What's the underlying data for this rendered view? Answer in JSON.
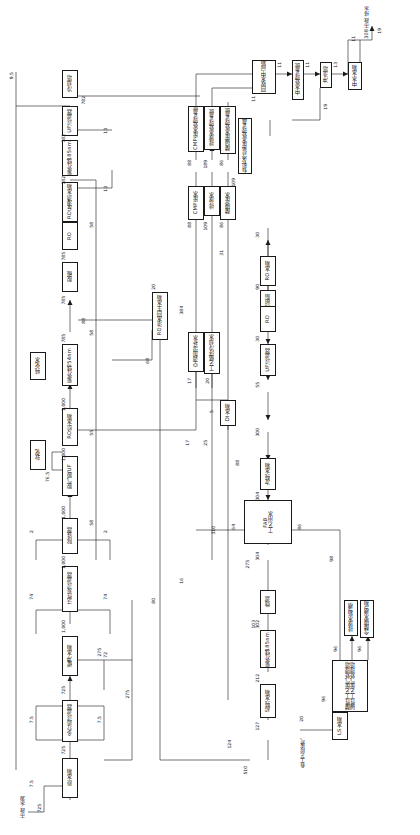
{
  "meta": {
    "orientation": "rotated-90-ccw",
    "language": "zh-CN"
  },
  "sources": [
    {
      "name": "municipal-water-source",
      "label": "市政\n水源",
      "value": "725"
    },
    {
      "name": "process-exhaust-source",
      "label": "各工艺段废气",
      "value": ""
    }
  ],
  "sinks": [
    {
      "name": "discharge-to-sewer",
      "label": "308 市政\n排水",
      "value": "13"
    }
  ],
  "boxes": [
    {
      "id": "raw-water-tank",
      "label": "原水箱"
    },
    {
      "id": "multimedia-filter",
      "label": "多介质过滤器"
    },
    {
      "id": "buffer-tank",
      "label": "缓冲水箱"
    },
    {
      "id": "activated-carbon",
      "label": "活性炭过滤器"
    },
    {
      "id": "iron-removal",
      "label": "除铁器"
    },
    {
      "id": "degas-uf",
      "label": "脱气膜/UF"
    },
    {
      "id": "softener",
      "label": "软化"
    },
    {
      "id": "ro-feed-tank",
      "label": "RO给水箱"
    },
    {
      "id": "uv-254",
      "label": "紫外线254nm"
    },
    {
      "id": "purified-water",
      "label": "纯化水"
    },
    {
      "id": "decarbonator",
      "label": "脱碳"
    },
    {
      "id": "ro-unit-1",
      "label": "RO"
    },
    {
      "id": "ro-permeate-tank",
      "label": "RO反渗透水箱"
    },
    {
      "id": "uv-185",
      "label": "紫外线185nm"
    },
    {
      "id": "uf-filter-top",
      "label": "UF过滤器"
    },
    {
      "id": "cooling-tower",
      "label": "冷却塔"
    },
    {
      "id": "ro-conc-reuse-tank",
      "label": "RO浓水回生水箱"
    },
    {
      "id": "cmp-waste-water",
      "label": "CMP废水"
    },
    {
      "id": "discharge-water",
      "label": "排放水"
    },
    {
      "id": "acid-alkali-waste",
      "label": "酸碱废水"
    },
    {
      "id": "cmp-waste-system",
      "label": "CMP废水处理系统"
    },
    {
      "id": "discharge-water-system",
      "label": "排放水处理系统"
    },
    {
      "id": "acid-alkali-system",
      "label": "酸碱废水处理系统"
    },
    {
      "id": "recycled-water-tank",
      "label": "回收水中间箱"
    },
    {
      "id": "reclaimed-treatment",
      "label": "中水处理系统"
    },
    {
      "id": "flush-tower",
      "label": "冲洗塔"
    },
    {
      "id": "reclaimed-tank",
      "label": "中水水箱"
    },
    {
      "id": "organic-ammonia-system",
      "label": "有机及含氨废水处理系统"
    },
    {
      "id": "hvac-humidify",
      "label": "空调加湿补水"
    },
    {
      "id": "process-cooling-water",
      "label": "工艺循环冷却水"
    },
    {
      "id": "di-tank",
      "label": "DI水箱"
    },
    {
      "id": "polisher",
      "label": "抛光树脂"
    },
    {
      "id": "uf-filter-mid",
      "label": "UF过滤器"
    },
    {
      "id": "ro-unit-2",
      "label": "RO"
    },
    {
      "id": "ro-tank",
      "label": "RO水箱"
    },
    {
      "id": "fab-process-water",
      "label": "FAB\n工艺用水"
    },
    {
      "id": "secondary-pure-water",
      "label": "次纯水箱"
    },
    {
      "id": "micro-filter",
      "label": "微滤"
    },
    {
      "id": "uv-185-b",
      "label": "紫外线185nm"
    },
    {
      "id": "ultrafilter",
      "label": "超纯水箱"
    },
    {
      "id": "ls-water-tank",
      "label": "LS水箱"
    },
    {
      "id": "acid-alkali-scrubbers",
      "label": "酸性工艺废气处理塔\n碱性工艺废气处理塔"
    },
    {
      "id": "discharge-water-tank2",
      "label": "排放水箱/槽"
    },
    {
      "id": "acid-alkali-tank2",
      "label": "含酸碱水槽/箱"
    }
  ],
  "stream_numbers": [
    "9.5",
    "725",
    "725",
    "725",
    "7.5",
    "7.5",
    "7.5",
    "275",
    "275",
    "275",
    "1,000",
    "1,000",
    "1,000",
    "1,000",
    "1,000",
    "2",
    "2",
    "2",
    "74",
    "74",
    "72",
    "76.5",
    "785",
    "785",
    "785",
    "782",
    "782",
    "782",
    "13",
    "13",
    "55",
    "58",
    "58",
    "58",
    "80",
    "88",
    "68",
    "20",
    "64",
    "310",
    "16",
    "103",
    "88",
    "86",
    "96",
    "98",
    "90",
    "30",
    "30",
    "275",
    "29",
    "20",
    "31",
    "88",
    "109",
    "189",
    "86",
    "86",
    "19",
    "19",
    "13",
    "11",
    "11",
    "11",
    "373",
    "19",
    "124",
    "510",
    "760",
    "96",
    "96",
    "20",
    "5",
    "17",
    "17",
    "25",
    "55",
    "300",
    "304",
    "304",
    "302",
    "212",
    "127",
    "125",
    "1271",
    "1255",
    "384",
    "383",
    "26",
    "88",
    "35"
  ],
  "annotations": {
    "ro-concentrate-note": "RO浓水回生水箱",
    "top-left-stream": "9.5",
    "municipal-inlet": "725",
    "discharge-outlet": "13"
  }
}
